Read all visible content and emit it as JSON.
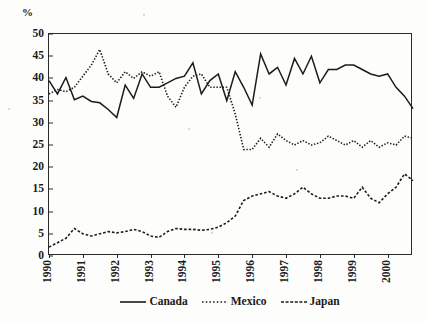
{
  "chart_data": {
    "type": "line",
    "title": "",
    "subtitle": "",
    "xlabel": "",
    "ylabel": "%",
    "ylim": [
      0,
      50
    ],
    "yticks": [
      0,
      5,
      10,
      15,
      20,
      25,
      30,
      35,
      40,
      45,
      50
    ],
    "xlim": [
      "1990",
      "2000.75"
    ],
    "xticks": [
      "1990",
      "1991",
      "1992",
      "1993",
      "1994",
      "1995",
      "1996",
      "1997",
      "1998",
      "1999",
      "2000"
    ],
    "grid": false,
    "legend_position": "bottom-center",
    "x_frequency": "quarterly",
    "x_values": [
      1990.0,
      1990.25,
      1990.5,
      1990.75,
      1991.0,
      1991.25,
      1991.5,
      1991.75,
      1992.0,
      1992.25,
      1992.5,
      1992.75,
      1993.0,
      1993.25,
      1993.5,
      1993.75,
      1994.0,
      1994.25,
      1994.5,
      1994.75,
      1995.0,
      1995.25,
      1995.5,
      1995.75,
      1996.0,
      1996.25,
      1996.5,
      1996.75,
      1997.0,
      1997.25,
      1997.5,
      1997.75,
      1998.0,
      1998.25,
      1998.5,
      1998.75,
      1999.0,
      1999.25,
      1999.5,
      1999.75,
      2000.0,
      2000.25,
      2000.5,
      2000.75
    ],
    "series": [
      {
        "name": "Canada",
        "style": "solid",
        "color": "#1b1b1b",
        "values": [
          39.5,
          36.5,
          40.2,
          35.2,
          36.0,
          34.8,
          34.5,
          33.0,
          31.2,
          38.5,
          35.5,
          41.0,
          38.0,
          38.0,
          39.0,
          40.0,
          40.5,
          43.5,
          36.5,
          39.5,
          41.0,
          35.0,
          41.5,
          38.0,
          34.0,
          45.5,
          41.0,
          42.5,
          38.5,
          44.5,
          41.0,
          45.0,
          39.0,
          42.0,
          42.0,
          43.0,
          43.0,
          42.0,
          41.0,
          40.5,
          41.0,
          38.0,
          36.0,
          33.2
        ]
      },
      {
        "name": "Mexico",
        "style": "dotted",
        "color": "#1b1b1b",
        "values": [
          36.5,
          37.5,
          37.0,
          38.0,
          40.5,
          43.0,
          46.5,
          41.0,
          39.0,
          41.5,
          40.0,
          41.5,
          40.5,
          41.5,
          36.0,
          33.5,
          38.0,
          40.5,
          41.0,
          38.0,
          38.0,
          38.0,
          32.0,
          24.0,
          24.0,
          26.5,
          24.5,
          27.5,
          26.0,
          25.0,
          26.0,
          25.0,
          25.5,
          27.0,
          26.0,
          25.0,
          26.0,
          24.5,
          26.0,
          24.5,
          25.5,
          25.0,
          27.0,
          26.5
        ]
      },
      {
        "name": "Japan",
        "style": "dashed",
        "color": "#1b1b1b",
        "values": [
          2.0,
          3.0,
          4.0,
          6.2,
          5.0,
          4.5,
          5.0,
          5.5,
          5.2,
          5.5,
          6.0,
          5.5,
          4.5,
          4.2,
          5.5,
          6.2,
          6.0,
          6.0,
          5.8,
          6.0,
          6.5,
          7.5,
          9.0,
          12.5,
          13.5,
          14.0,
          14.5,
          13.5,
          13.0,
          14.0,
          15.5,
          14.0,
          13.0,
          13.0,
          13.5,
          13.5,
          13.0,
          15.5,
          13.0,
          12.0,
          14.0,
          15.5,
          18.5,
          17.0
        ]
      }
    ],
    "legend": [
      {
        "label": "Canada",
        "style": "solid"
      },
      {
        "label": "Mexico",
        "style": "dotted"
      },
      {
        "label": "Japan",
        "style": "dashed"
      }
    ]
  }
}
